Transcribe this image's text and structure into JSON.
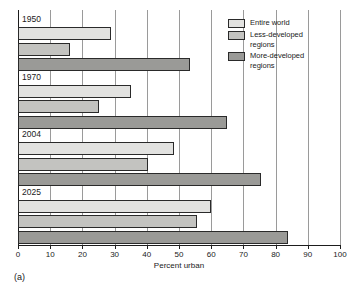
{
  "chart_data": {
    "type": "bar",
    "orientation": "horizontal",
    "title": "",
    "xlabel": "Percent urban",
    "ylabel": "",
    "xlim": [
      0,
      100
    ],
    "xticks": [
      0,
      10,
      20,
      30,
      40,
      50,
      60,
      70,
      80,
      90,
      100
    ],
    "grid": true,
    "legend_position": "top-right",
    "categories": [
      "1950",
      "1970",
      "2004",
      "2025"
    ],
    "series": [
      {
        "name": "Entire world",
        "values": [
          29,
          35,
          48.5,
          60
        ]
      },
      {
        "name": "Less-developed\nregions",
        "values": [
          16,
          25,
          40.5,
          55.5
        ]
      },
      {
        "name": "More-developed\nregions",
        "values": [
          53.5,
          65,
          75.5,
          84
        ]
      }
    ],
    "caption": "(a)"
  },
  "colors": {
    "series0": "#e2e2e0",
    "series1": "#c3c3c0",
    "series2": "#9a9a97",
    "outline": "#2a2a2a",
    "grid": "#9a9a9a",
    "axis": "#1d1d1d"
  }
}
